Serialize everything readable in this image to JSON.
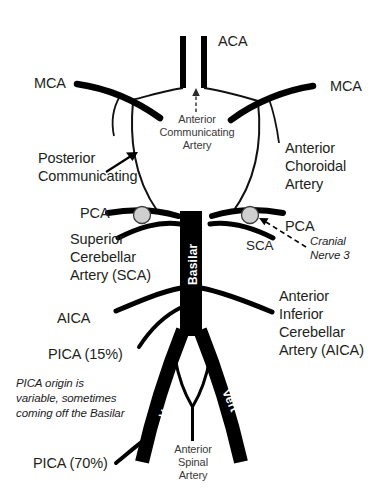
{
  "diagram": {
    "background_color": "#ffffff",
    "vessel_color": "#000000",
    "thin_vessel_color": "#1a1a1a",
    "text_color": "#231f20",
    "nerve_circle_fill": "#cfcfcf",
    "nerve_circle_stroke": "#3d3d3d"
  },
  "labels": {
    "aca": "ACA",
    "acom_line1": "Anterior",
    "acom_line2": "Communicating",
    "acom_line3": "Artery",
    "mca_left": "MCA",
    "mca_right": "MCA",
    "pcom_line1": "Posterior",
    "pcom_line2": "Communicating",
    "anterior_choroidal_line1": "Anterior",
    "anterior_choroidal_line2": "Choroidal",
    "anterior_choroidal_line3": "Artery",
    "pca_left": "PCA",
    "pca_right": "PCA",
    "sca_left_line1": "Superior",
    "sca_left_line2": "Cerebellar",
    "sca_left_line3": "Artery (SCA)",
    "sca_right": "SCA",
    "cranial_nerve_line1": "Cranial",
    "cranial_nerve_line2": "Nerve 3",
    "basilar": "Basilar",
    "aica_left": "AICA",
    "aica_right_line1": "Anterior",
    "aica_right_line2": "Inferior",
    "aica_right_line3": "Cerebellar",
    "aica_right_line4": "Artery (AICA)",
    "pica_15": "PICA (15%)",
    "pica_70": "PICA (70%)",
    "pica_note_line1": "PICA origin is",
    "pica_note_line2": "variable, sometimes",
    "pica_note_line3": "coming off the Basilar",
    "vert_left": "Vert",
    "vert_right": "Vert",
    "anterior_spinal_line1": "Anterior",
    "anterior_spinal_line2": "Spinal",
    "anterior_spinal_line3": "Artery"
  }
}
